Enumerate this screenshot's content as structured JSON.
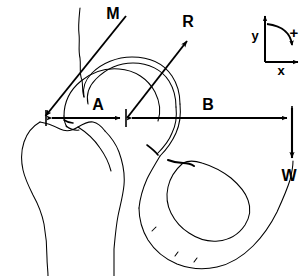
{
  "figure": {
    "background_color": "#ffffff",
    "line_color": "#000000",
    "labels": {
      "muscle_force": "M",
      "joint_reaction_force": "R",
      "moment_arm_a": "A",
      "moment_arm_b": "B",
      "body_weight": "W"
    },
    "axes_legend": {
      "y_label": "y",
      "x_label": "x",
      "sign_label": "+"
    },
    "vectors": [
      {
        "name": "M",
        "label": "M",
        "description": "abductor muscle force acting on greater trochanter",
        "from": [
          126,
          16
        ],
        "to": [
          44,
          117
        ],
        "label_pos": [
          113,
          18
        ]
      },
      {
        "name": "R",
        "label": "R",
        "description": "joint reaction force at femoral head center",
        "from": [
          127,
          118
        ],
        "to": [
          188,
          40
        ],
        "label_pos": [
          187,
          26
        ]
      },
      {
        "name": "W",
        "label": "W",
        "description": "body weight acting downward",
        "from": [
          292,
          108
        ],
        "to": [
          292,
          160
        ],
        "label_pos": [
          283,
          178
        ]
      }
    ],
    "dimensions": [
      {
        "name": "A",
        "label": "A",
        "description": "moment arm from trochanter to femoral head center",
        "from": [
          46,
          118
        ],
        "to": [
          124,
          118
        ],
        "label_pos": [
          98,
          109
        ]
      },
      {
        "name": "B",
        "label": "B",
        "description": "moment arm from femoral head center to body weight line",
        "from": [
          128,
          118
        ],
        "to": [
          292,
          118
        ],
        "label_pos": [
          208,
          109
        ]
      }
    ]
  }
}
